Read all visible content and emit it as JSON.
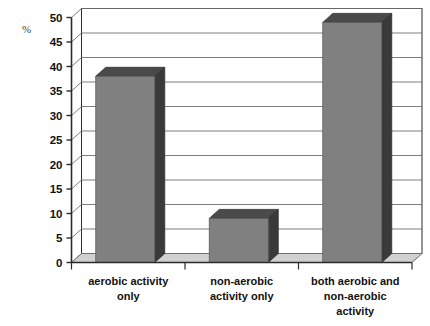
{
  "chart_data": {
    "type": "bar",
    "title": "",
    "subtitle": "",
    "xlabel": "",
    "ylabel": "%",
    "unit_label": "%",
    "categories": [
      "aerobic activity only",
      "non-aerobic activity only",
      "both aerobic and non-aerobic activity"
    ],
    "category_lines": [
      [
        "aerobic activity",
        "only"
      ],
      [
        "non-aerobic",
        "activity only"
      ],
      [
        "both aerobic and",
        "non-aerobic",
        "activity"
      ]
    ],
    "values": [
      38,
      9,
      49
    ],
    "ylim": [
      0,
      50
    ],
    "ytick_step": 5,
    "ytick_labels": [
      "0",
      "5",
      "10",
      "15",
      "20",
      "25",
      "30",
      "35",
      "40",
      "45",
      "50"
    ],
    "ytick_values": [
      0,
      5,
      10,
      15,
      20,
      25,
      30,
      35,
      40,
      45,
      50
    ],
    "grid": true,
    "grid_axis": "y",
    "legend": false,
    "legend_position": "none",
    "style": "3d-column",
    "annotations": []
  },
  "colors": {
    "background": "#ffffff",
    "bar_front": "#808080",
    "bar_side": "#3a3a3a",
    "bar_top": "#4a4a4a",
    "floor": "#d0d0d0",
    "floor_edge": "#9a9a9a",
    "gridline": "#6f6f6f",
    "axis_line": "#2b2b2b",
    "tick_text": "#111111",
    "wall": "#ffffff"
  }
}
